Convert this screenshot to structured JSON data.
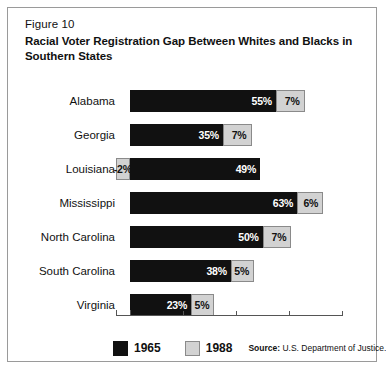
{
  "figure": {
    "number": "Figure 10",
    "title": "Racial Voter Registration Gap Between Whites and Blacks in Southern States"
  },
  "legend": {
    "items": [
      {
        "label": "1965",
        "color": "#111111"
      },
      {
        "label": "1988",
        "color": "#d2d2d2"
      }
    ],
    "source_prefix": "Source:",
    "source_text": "U.S. Department of Justice."
  },
  "chart_data": {
    "type": "bar",
    "orientation": "horizontal",
    "title": "Racial Voter Registration Gap Between Whites and Blacks in Southern States",
    "xlabel": "",
    "ylabel": "",
    "xlim": [
      -5,
      80
    ],
    "grid": false,
    "legend_position": "bottom",
    "axis_ticks": [
      0,
      20,
      40,
      60,
      80
    ],
    "axis_tick_labels": [
      "",
      "",
      "",
      "",
      ""
    ],
    "categories": [
      "Alabama",
      "Georgia",
      "Louisiana",
      "Mississippi",
      "North Carolina",
      "South Carolina",
      "Virginia"
    ],
    "series": [
      {
        "name": "1965",
        "color": "#111111",
        "values": [
          55,
          35,
          49,
          63,
          50,
          38,
          23
        ]
      },
      {
        "name": "1988",
        "color": "#d2d2d2",
        "values": [
          7,
          7,
          -2,
          6,
          7,
          5,
          5
        ]
      }
    ],
    "value_labels": {
      "1965": [
        "55%",
        "35%",
        "49%",
        "63%",
        "50%",
        "38%",
        "23%"
      ],
      "1988": [
        "7%",
        "7%",
        "-2%",
        "6%",
        "7%",
        "5%",
        "5%"
      ]
    }
  }
}
